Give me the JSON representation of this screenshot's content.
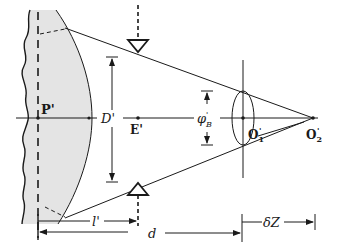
{
  "diagram": {
    "labels": {
      "P": "P'",
      "D": "D'",
      "E": "E'",
      "phiB_main": "φ",
      "phiB_sub": "B",
      "phiB_sup": "'",
      "O1_main": "O",
      "O1_sub": "1",
      "O1_sup": "'",
      "O2_main": "O",
      "O2_sub": "2",
      "O2_sup": "'",
      "l": "l'",
      "d": "d",
      "dZ": "δZ"
    },
    "colors": {
      "line": "#1a1a1a",
      "region_fill": "#e4e4e4",
      "background": "#ffffff"
    }
  }
}
